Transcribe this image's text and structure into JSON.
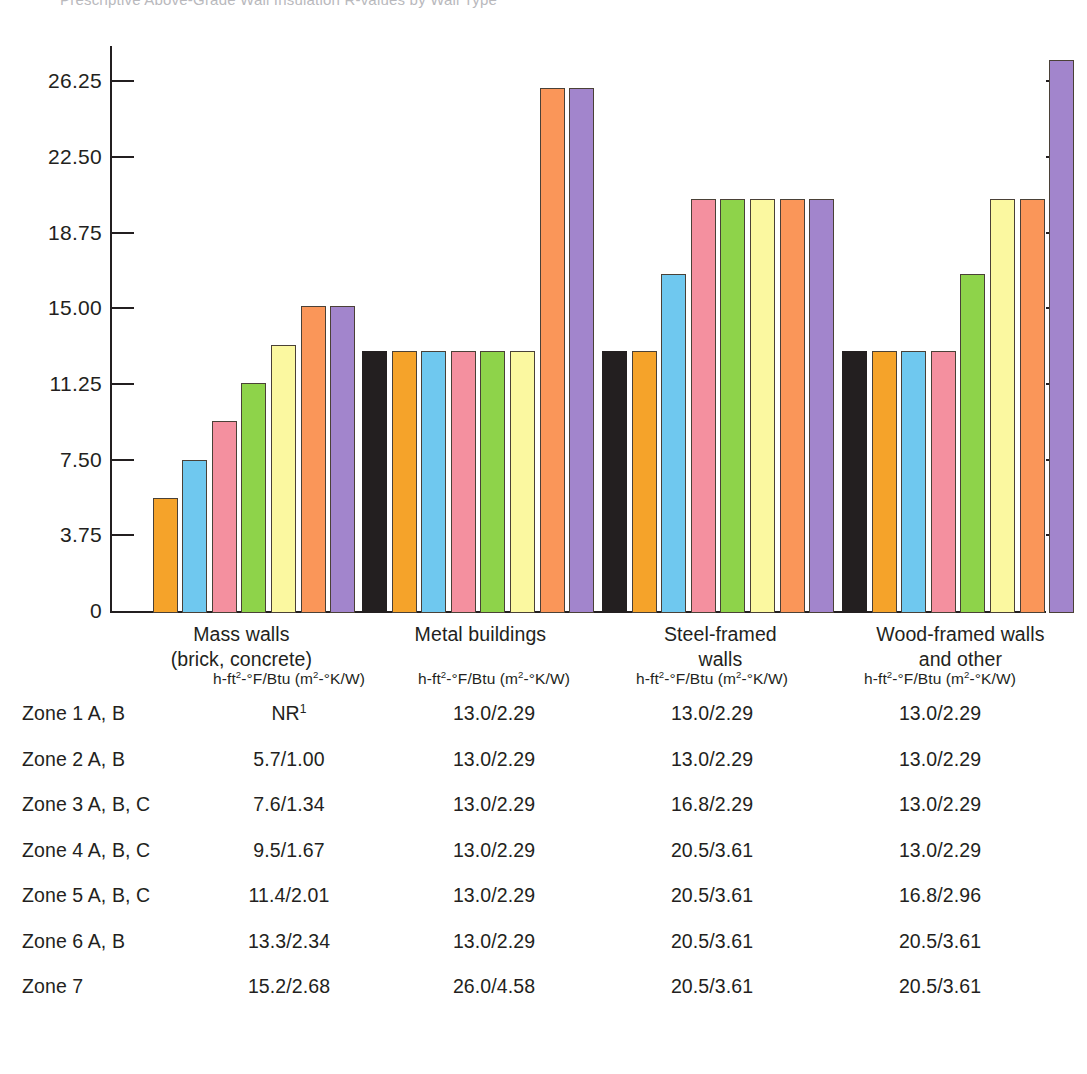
{
  "clipped_title": "Prescriptive Above-Grade Wall Insulation R-values by Wall Type",
  "chart_data": {
    "type": "bar",
    "title": "",
    "xlabel": "",
    "ylabel": "",
    "ylim": [
      0,
      28.0
    ],
    "grid": false,
    "legend": "none",
    "yticks": [
      "0",
      "3.75",
      "7.50",
      "11.25",
      "15.00",
      "18.75",
      "22.50",
      "26.25"
    ],
    "ytick_values": [
      0,
      3.75,
      7.5,
      11.25,
      15,
      18.75,
      22.5,
      26.25
    ],
    "categories": [
      "Mass walls\n(brick, concrete)",
      "Metal buildings",
      "Steel-framed\nwalls",
      "Wood-framed walls\nand other"
    ],
    "series": [
      {
        "name": "Zone 1 A, B",
        "color": "#231f20",
        "values": [
          null,
          13.0,
          13.0,
          13.0
        ]
      },
      {
        "name": "Zone 2 A, B",
        "color": "#f5a32a",
        "values": [
          5.7,
          13.0,
          13.0,
          13.0
        ]
      },
      {
        "name": "Zone 3 A, B, C",
        "color": "#6fc8ef",
        "values": [
          7.6,
          13.0,
          16.8,
          13.0
        ]
      },
      {
        "name": "Zone 4 A, B, C",
        "color": "#f4909f",
        "values": [
          9.5,
          13.0,
          20.5,
          13.0
        ]
      },
      {
        "name": "Zone 5 A, B, C",
        "color": "#8ed34a",
        "values": [
          11.4,
          13.0,
          20.5,
          16.8
        ]
      },
      {
        "name": "Zone 6 A, B",
        "color": "#fbf8a0",
        "values": [
          13.3,
          13.0,
          20.5,
          20.5
        ]
      },
      {
        "name": "Zone 7",
        "color": "#fa9659",
        "values": [
          15.2,
          26.0,
          20.5,
          20.5
        ]
      },
      {
        "name": "Zone 7 (alt)",
        "color": "#a285cc",
        "values": [
          15.2,
          26.0,
          20.5,
          27.4
        ]
      }
    ]
  },
  "table": {
    "units_header": "h-ft²-°F/Btu (m²-°K/W)",
    "columns": [
      "Mass walls (brick, concrete)",
      "Metal buildings",
      "Steel-framed walls",
      "Wood-framed walls and other"
    ],
    "rows": [
      {
        "zone": "Zone 1 A, B",
        "c1": "NR",
        "c1_sup": "1",
        "c2": "13.0/2.29",
        "c3": "13.0/2.29",
        "c4": "13.0/2.29"
      },
      {
        "zone": "Zone 2 A, B",
        "c1": "5.7/1.00",
        "c1_sup": "",
        "c2": "13.0/2.29",
        "c3": "13.0/2.29",
        "c4": "13.0/2.29"
      },
      {
        "zone": "Zone 3 A, B, C",
        "c1": "7.6/1.34",
        "c1_sup": "",
        "c2": "13.0/2.29",
        "c3": "16.8/2.29",
        "c4": "13.0/2.29"
      },
      {
        "zone": "Zone 4 A, B, C",
        "c1": "9.5/1.67",
        "c1_sup": "",
        "c2": "13.0/2.29",
        "c3": "20.5/3.61",
        "c4": "13.0/2.29"
      },
      {
        "zone": "Zone 5 A, B, C",
        "c1": "11.4/2.01",
        "c1_sup": "",
        "c2": "13.0/2.29",
        "c3": "20.5/3.61",
        "c4": "16.8/2.96"
      },
      {
        "zone": "Zone 6 A, B",
        "c1": "13.3/2.34",
        "c1_sup": "",
        "c2": "13.0/2.29",
        "c3": "20.5/3.61",
        "c4": "20.5/3.61"
      },
      {
        "zone": "Zone 7",
        "c1": "15.2/2.68",
        "c1_sup": "",
        "c2": "26.0/4.58",
        "c3": "20.5/3.61",
        "c4": "20.5/3.61"
      }
    ]
  }
}
